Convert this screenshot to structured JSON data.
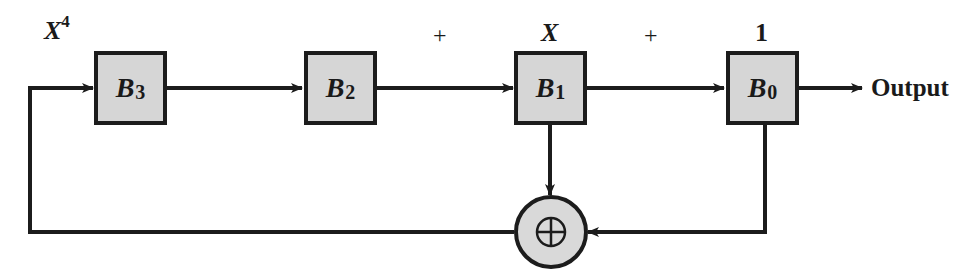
{
  "diagram": {
    "type": "LFSR polynomial divider / CRC shift register",
    "registers": [
      {
        "id": "B3",
        "name": "B",
        "sub": "3",
        "top_label": "X",
        "top_label_sup": "4"
      },
      {
        "id": "B2",
        "name": "B",
        "sub": "2",
        "top_label": "",
        "top_label_sup": ""
      },
      {
        "id": "B1",
        "name": "B",
        "sub": "1",
        "top_label": "X",
        "top_label_sup": ""
      },
      {
        "id": "B0",
        "name": "B",
        "sub": "0",
        "top_label": "1",
        "top_label_sup": ""
      }
    ],
    "plus_labels": [
      "+",
      "+"
    ],
    "output_label": "Output",
    "xor_symbol": "⊕",
    "colors": {
      "line": "#1c1c1c",
      "block_fill": "#d6d6d6",
      "xor_fill": "#d9d9d9"
    }
  }
}
